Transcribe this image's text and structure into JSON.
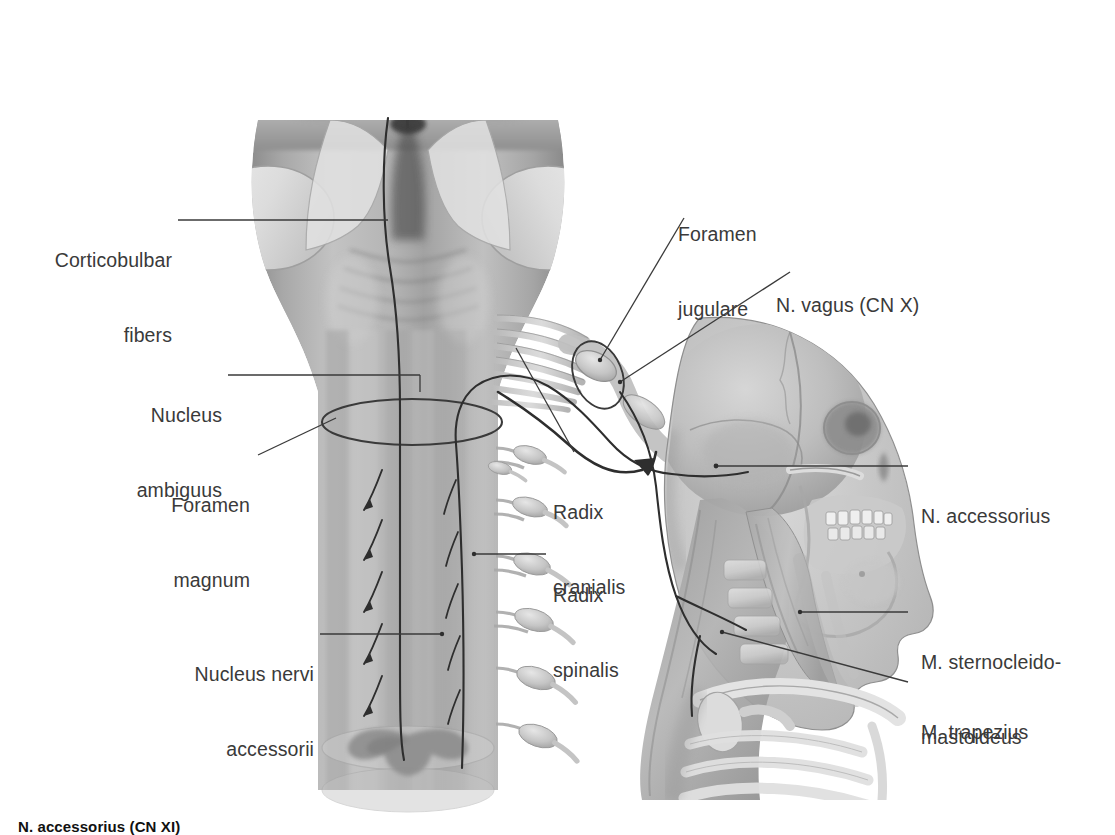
{
  "figure": {
    "caption": "N. accessorius (CN XI)",
    "colors": {
      "text": "#3a3a3a",
      "caption_text": "#111111",
      "leader_line": "#3a3a3a",
      "background": "#ffffff",
      "tissue_mid": "#9a9a9a",
      "tissue_dark": "#5d5d5d",
      "tissue_light": "#d8d8d8",
      "bone": "#b9b9b9",
      "nerve_trace": "#2e2e2e"
    }
  },
  "labels": [
    {
      "id": "corticobulbar-fibers",
      "line1": "Corticobulbar",
      "line2": "fibers",
      "align": "right"
    },
    {
      "id": "nucleus-ambiguus",
      "line1": "Nucleus",
      "line2": "ambiguus",
      "align": "right"
    },
    {
      "id": "foramen-magnum",
      "line1": "Foramen",
      "line2": "magnum",
      "align": "right"
    },
    {
      "id": "nucleus-nervi-accessorii",
      "line1": "Nucleus nervi",
      "line2": "accessorii",
      "align": "right"
    },
    {
      "id": "foramen-jugulare",
      "line1": "Foramen",
      "line2": "jugulare",
      "align": "left"
    },
    {
      "id": "n-vagus",
      "line1": "N. vagus (CN X)",
      "line2": "",
      "align": "left"
    },
    {
      "id": "radix-cranialis",
      "line1": "Radix",
      "line2": "cranialis",
      "align": "left"
    },
    {
      "id": "radix-spinalis",
      "line1": "Radix",
      "line2": "spinalis",
      "align": "left"
    },
    {
      "id": "n-accessorius",
      "line1": "N. accessorius",
      "line2": "",
      "align": "left"
    },
    {
      "id": "m-sternocleidomastoideus",
      "line1": "M. sternocleido-",
      "line2": "mastoideus",
      "align": "left"
    },
    {
      "id": "m-trapezius",
      "line1": "M. trapezius",
      "line2": "",
      "align": "left"
    }
  ]
}
